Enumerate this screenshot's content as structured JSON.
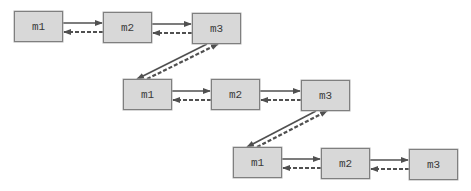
{
  "diagram": {
    "type": "linked-list-chain",
    "colors": {
      "node_fill": "#d8d8d8",
      "node_border": "#7f7f7f",
      "text": "#3a3a3a",
      "arrow": "#505050"
    },
    "rows": [
      {
        "nodes": [
          {
            "id": "r1m1",
            "label": "m1",
            "x": 14,
            "y": 11
          },
          {
            "id": "r1m2",
            "label": "m2",
            "x": 103,
            "y": 12
          },
          {
            "id": "r1m3",
            "label": "m3",
            "x": 192,
            "y": 13
          }
        ]
      },
      {
        "nodes": [
          {
            "id": "r2m1",
            "label": "m1",
            "x": 123,
            "y": 79
          },
          {
            "id": "r2m2",
            "label": "m2",
            "x": 211,
            "y": 79
          },
          {
            "id": "r2m3",
            "label": "m3",
            "x": 301,
            "y": 80
          }
        ]
      },
      {
        "nodes": [
          {
            "id": "r3m1",
            "label": "m1",
            "x": 233,
            "y": 147
          },
          {
            "id": "r3m2",
            "label": "m2",
            "x": 321,
            "y": 148
          },
          {
            "id": "r3m3",
            "label": "m3",
            "x": 409,
            "y": 149
          }
        ]
      }
    ],
    "edges": [
      {
        "from": "r1m1",
        "to": "r1m2",
        "style": "solid"
      },
      {
        "from": "r1m2",
        "to": "r1m1",
        "style": "dashed"
      },
      {
        "from": "r1m2",
        "to": "r1m3",
        "style": "solid"
      },
      {
        "from": "r1m3",
        "to": "r1m2",
        "style": "dashed"
      },
      {
        "from": "r1m3",
        "to": "r2m1",
        "style": "solid"
      },
      {
        "from": "r2m1",
        "to": "r1m3",
        "style": "dashed"
      },
      {
        "from": "r2m1",
        "to": "r2m2",
        "style": "solid"
      },
      {
        "from": "r2m2",
        "to": "r2m1",
        "style": "dashed"
      },
      {
        "from": "r2m2",
        "to": "r2m3",
        "style": "solid"
      },
      {
        "from": "r2m3",
        "to": "r2m2",
        "style": "dashed"
      },
      {
        "from": "r2m3",
        "to": "r3m1",
        "style": "solid"
      },
      {
        "from": "r3m1",
        "to": "r2m3",
        "style": "dashed"
      },
      {
        "from": "r3m1",
        "to": "r3m2",
        "style": "solid"
      },
      {
        "from": "r3m2",
        "to": "r3m1",
        "style": "dashed"
      },
      {
        "from": "r3m2",
        "to": "r3m3",
        "style": "solid"
      },
      {
        "from": "r3m3",
        "to": "r3m2",
        "style": "dashed"
      }
    ]
  }
}
